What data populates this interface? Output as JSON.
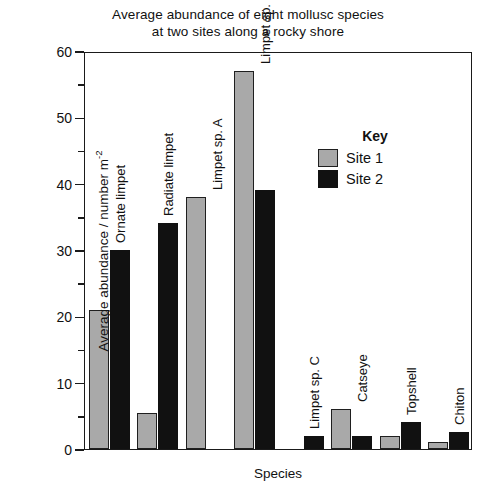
{
  "chart_data": {
    "type": "bar",
    "title": "Average abundance of eight mollusc species at two sites along a rocky shore",
    "title_lines": [
      "Average abundance of eight mollusc species",
      "at two sites along a rocky shore"
    ],
    "xlabel": "Species",
    "ylabel": "Average abundance / number m",
    "ylabel_exponent": "-2",
    "ylim": [
      0,
      60
    ],
    "yticks": [
      0,
      10,
      20,
      30,
      40,
      50,
      60
    ],
    "ytick_labels": [
      "0",
      "10",
      "20",
      "30",
      "40",
      "50",
      "60"
    ],
    "yminor_step": 5,
    "grid": false,
    "legend_position": "inside-upper-right",
    "legend_title": "Key",
    "categories": [
      "Ornate limpet",
      "Radiate limpet",
      "Limpet sp. A",
      "Limpet sp. B",
      "Limpet sp. C",
      "Catseye",
      "Topshell",
      "Chiton"
    ],
    "series": [
      {
        "name": "Site 1",
        "color": "#a9a9a9",
        "values": [
          21,
          5.5,
          38,
          57,
          0,
          6,
          2,
          1
        ]
      },
      {
        "name": "Site 2",
        "color": "#111111",
        "values": [
          30,
          34,
          0,
          39,
          2,
          2,
          4,
          2.5
        ]
      }
    ]
  },
  "legend": {
    "title": "Key",
    "entries": [
      {
        "label": "Site 1",
        "swatch": "s1"
      },
      {
        "label": "Site 2",
        "swatch": "s2"
      }
    ]
  }
}
